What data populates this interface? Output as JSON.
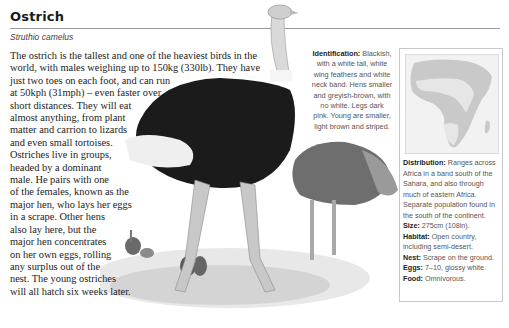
{
  "header": {
    "title": "Ostrich",
    "species": "Struthio camelus"
  },
  "body": {
    "lines": [
      "The ostrich is the tallest and one of the heaviest birds in the",
      "world, with males weighing up to 150kg (330lb). They have",
      "just two toes on each foot, and can run",
      "at 50kph (31mph) – even faster over",
      "short distances. They will eat",
      "almost anything, from plant",
      "matter and carrion to lizards",
      "and even small tortoises.",
      "Ostriches live in groups,",
      "headed by a dominant",
      "male. He pairs with one",
      "of the females, known as the",
      "major hen, who lays her eggs",
      "in a scrape. Other hens",
      "also lay here, but the",
      "major hen concentrates",
      "on her own eggs, rolling",
      "any surplus out of the",
      "nest. The young ostriches",
      "will all hatch six weeks later."
    ]
  },
  "identification": {
    "label": "Identification:",
    "first": " Blackish,",
    "lines": [
      "with a white tail, white",
      "wing feathers and white",
      "neck band. Hens smaller",
      "and greyish-brown, with",
      "no white. Legs dark",
      "pink. Young are smaller,",
      "light brown and striped."
    ]
  },
  "panel": {
    "map_label": "Distribution map of Africa",
    "distribution": {
      "label": "Distribution:",
      "first": " Ranges across",
      "lines": [
        "Africa in a band south of the",
        "Sahara, and also through",
        "much of eastern Africa.",
        "Separate population found in",
        "the south of the continent."
      ]
    },
    "size": {
      "label": "Size:",
      "value": " 275cm (108in)."
    },
    "habitat": {
      "label": "Habitat:",
      "value": " Open country,",
      "cont": "including semi-desert."
    },
    "nest": {
      "label": "Nest:",
      "value": " Scrape on the ground."
    },
    "eggs": {
      "label": "Eggs:",
      "value": " 7–10, glossy white."
    },
    "food": {
      "label": "Food:",
      "value": " Omnivorous."
    }
  },
  "colors": {
    "map_land": "#c9c9c9",
    "map_range": "#e6e6e6",
    "map_bg": "#f2f2f2"
  }
}
